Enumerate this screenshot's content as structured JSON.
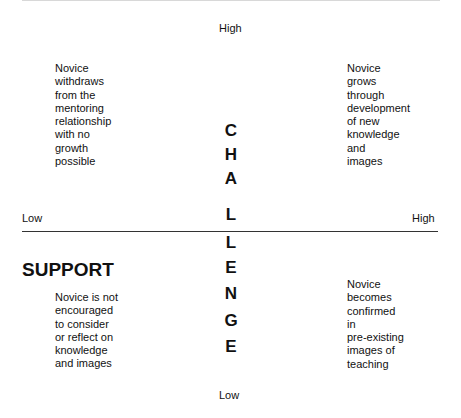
{
  "diagram": {
    "vertical_axis": {
      "label_letters": [
        "C",
        "H",
        "A",
        "L",
        "L",
        "E",
        "N",
        "G",
        "E"
      ],
      "label": "CHALLENGE",
      "high": "High",
      "low": "Low"
    },
    "horizontal_axis": {
      "label": "SUPPORT",
      "low": "Low",
      "high": "High"
    },
    "quadrants": {
      "top_left": "Novice\nwithdraws\nfrom the\nmentoring\nrelationship\nwith no\ngrowth\npossible",
      "top_right": "Novice\ngrows\nthrough\ndevelopment\nof new\nknowledge\nand\nimages",
      "bottom_left": "Novice is not\nencouraged\nto consider\nor reflect on\nknowledge\nand images",
      "bottom_right": "Novice\nbecomes\nconfirmed\nin\npre-existing\nimages of\nteaching"
    }
  }
}
